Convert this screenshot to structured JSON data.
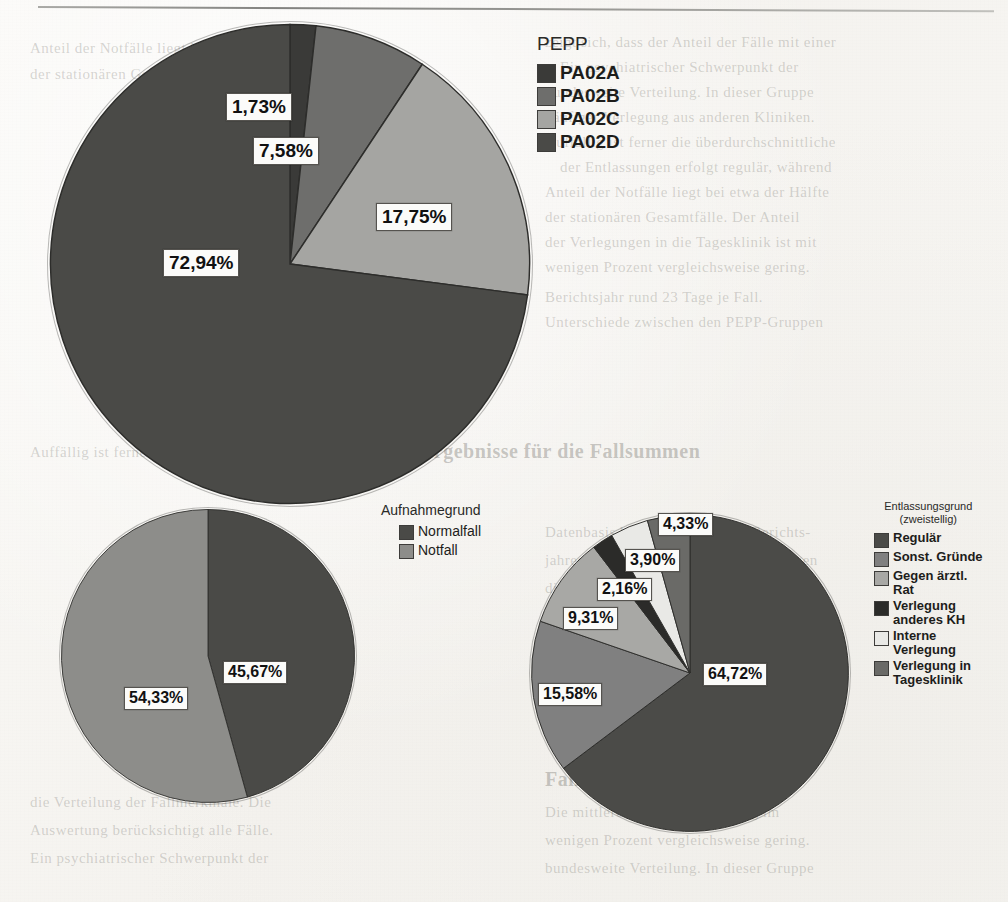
{
  "page": {
    "background_color": "#f7f6f3",
    "rule_color": "#6d6d6a",
    "ghost_text": [
      "zeigt sich, dass der Anteil der Fälle mit einer",
      "Ein psychiatrischer Schwerpunkt der",
      "bundesweite Verteilung. In dieser Gruppe",
      "häufiger Verlegung aus anderen Kliniken.",
      "Auffällig ist ferner die überdurchschnittliche",
      "der Entlassungen erfolgt regulär, während",
      "Anteil der Notfälle liegt bei etwa der Hälfte",
      "der stationären Gesamtfälle. Der Anteil",
      "der Verlegungen in die Tagesklinik ist mit",
      "wenigen Prozent vergleichsweise gering.",
      "Ergebnisse für die Fallsummen",
      "Datenbasis bilden die Fälle des Berichts-",
      "jahres. Die folgenden Abbildungen zeigen",
      "die Verteilung der Fallmerkmale. Die",
      "Auswertung berücksichtigt alle Fälle.",
      "Fallzahl und Verweildauer",
      "Die mittlere Verweildauer betrug im",
      "Berichtsjahr rund 23 Tage je Fall.",
      "Unterschiede zwischen den PEPP-Gruppen"
    ]
  },
  "chart_data": [
    {
      "id": "pepp-pie",
      "type": "pie",
      "title": "",
      "legend_title": "PEPP",
      "legend_position": "right",
      "start_angle_deg": 0,
      "direction": "clockwise",
      "categories": [
        "PA02A",
        "PA02B",
        "PA02C",
        "PA02D"
      ],
      "values": [
        1.73,
        7.58,
        17.75,
        72.94
      ],
      "labels": [
        "1,73%",
        "7,58%",
        "17,75%",
        "72,94%"
      ],
      "colors": [
        "#3a3a38",
        "#6e6e6c",
        "#a5a5a2",
        "#4a4a47"
      ]
    },
    {
      "id": "aufnahmegrund-pie",
      "type": "pie",
      "title": "",
      "legend_title": "Aufnahmegrund",
      "legend_position": "right",
      "start_angle_deg": 0,
      "direction": "clockwise",
      "categories": [
        "Normalfall",
        "Notfall"
      ],
      "values": [
        45.67,
        54.33
      ],
      "labels": [
        "45,67%",
        "54,33%"
      ],
      "colors": [
        "#4a4a47",
        "#8d8d8a"
      ]
    },
    {
      "id": "entlassungsgrund-pie",
      "type": "pie",
      "title": "",
      "legend_title": "Entlassungsgrund\n(zweistellig)",
      "legend_position": "right",
      "start_angle_deg": 0,
      "direction": "clockwise",
      "categories": [
        "Regulär",
        "Sonst. Gründe",
        "Gegen ärztl. Rat",
        "Verlegung anderes KH",
        "Interne Verlegung",
        "Verlegung in Tagesklinik"
      ],
      "values": [
        64.72,
        15.58,
        9.31,
        2.16,
        3.9,
        4.33
      ],
      "labels": [
        "64,72%",
        "15,58%",
        "9,31%",
        "2,16%",
        "3,90%",
        "4,33%"
      ],
      "colors": [
        "#4b4b48",
        "#808080",
        "#a8a8a5",
        "#2b2b29",
        "#e9e9e6",
        "#6a6a67"
      ]
    }
  ],
  "pepp_chart": {
    "legend_title": "PEPP",
    "items": [
      {
        "label": "PA02A",
        "color": "#3a3a38",
        "value": "1,73%"
      },
      {
        "label": "PA02B",
        "color": "#6e6e6c",
        "value": "7,58%"
      },
      {
        "label": "PA02C",
        "color": "#a5a5a2",
        "value": "17,75%"
      },
      {
        "label": "PA02D",
        "color": "#4a4a47",
        "value": "72,94%"
      }
    ],
    "callouts": [
      "1,73%",
      "7,58%",
      "17,75%",
      "72,94%"
    ]
  },
  "aufnahme_chart": {
    "legend_title": "Aufnahmegrund",
    "items": [
      {
        "label": "Normalfall",
        "color": "#4a4a47",
        "value": "45,67%"
      },
      {
        "label": "Notfall",
        "color": "#8d8d8a",
        "value": "54,33%"
      }
    ],
    "callouts": [
      "45,67%",
      "54,33%"
    ]
  },
  "entlassung_chart": {
    "legend_title": "Entlassungsgrund\n(zweistellig)",
    "items": [
      {
        "label": "Regulär",
        "color": "#4b4b48",
        "value": "64,72%"
      },
      {
        "label": "Sonst. Gründe",
        "color": "#808080",
        "value": "15,58%"
      },
      {
        "label": "Gegen ärztl.\nRat",
        "color": "#a8a8a5",
        "value": "9,31%"
      },
      {
        "label": "Verlegung\nanderes KH",
        "color": "#2b2b29",
        "value": "2,16%"
      },
      {
        "label": "Interne\nVerlegung",
        "color": "#e9e9e6",
        "value": "3,90%"
      },
      {
        "label": "Verlegung in\nTagesklinik",
        "color": "#6a6a67",
        "value": "4,33%"
      }
    ],
    "callouts": [
      "64,72%",
      "15,58%",
      "9,31%",
      "2,16%",
      "3,90%",
      "4,33%"
    ]
  }
}
